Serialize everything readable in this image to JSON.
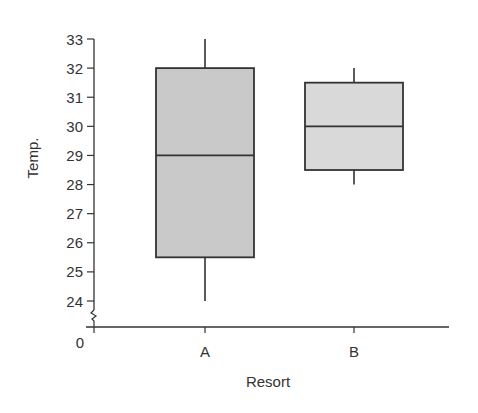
{
  "chart_data": {
    "type": "box",
    "title": "",
    "xlabel": "Resort",
    "ylabel": "Temp.",
    "categories": [
      "A",
      "B"
    ],
    "y_ticks": [
      24,
      25,
      26,
      27,
      28,
      29,
      30,
      31,
      32,
      33
    ],
    "y_origin_label": "0",
    "y_axis_break": true,
    "ylim": [
      24,
      33
    ],
    "grid": false,
    "legend": null,
    "series": [
      {
        "name": "A",
        "min": 24,
        "q1": 25.5,
        "median": 29,
        "q3": 32,
        "max": 33,
        "fill": "#c9c9c9"
      },
      {
        "name": "B",
        "min": 28,
        "q1": 28.5,
        "median": 30,
        "q3": 31.5,
        "max": 32,
        "fill": "#d9d9d9"
      }
    ]
  },
  "axes": {
    "x_title": "Resort",
    "y_title": "Temp.",
    "origin_label": "0"
  },
  "colors": {
    "stroke": "#333333",
    "box_a_fill": "#c9c9c9",
    "box_b_fill": "#d9d9d9"
  }
}
